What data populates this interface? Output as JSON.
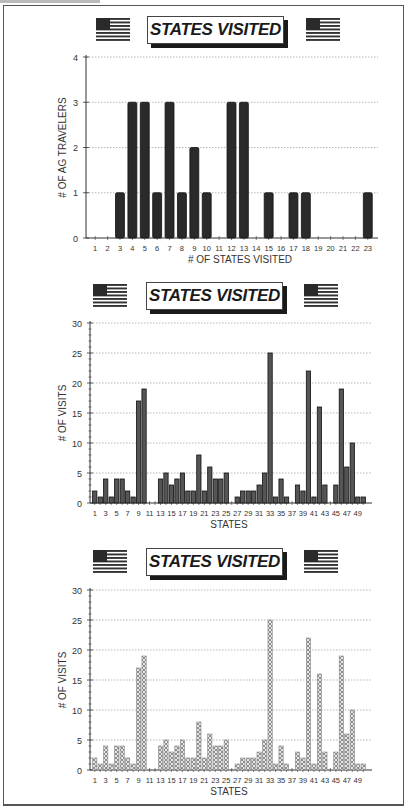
{
  "page": {
    "panels": [
      {
        "title": "STATES VISITED",
        "left_icon": "us-flag-icon",
        "right_icon": "us-flag-icon"
      },
      {
        "title": "STATES VISITED",
        "left_icon": "us-flag-icon",
        "right_icon": "us-flag-icon"
      },
      {
        "title": "STATES VISITED",
        "left_icon": "us-flag-icon",
        "right_icon": "us-flag-icon"
      }
    ],
    "colors": {
      "bar_solid": "#2a2a2a",
      "bar_medium": "#555555",
      "bar_hatched": "#bdbdbd",
      "grid": "#999999",
      "axis": "#333333"
    }
  },
  "chart_data": [
    {
      "type": "bar",
      "title": "STATES VISITED",
      "xlabel": "# OF STATES VISITED",
      "ylabel": "# OF AG TRAVELERS",
      "ylim": [
        0,
        4
      ],
      "yticks": [
        0,
        1,
        2,
        3,
        4
      ],
      "grid": true,
      "legend": null,
      "categories": [
        "1",
        "2",
        "3",
        "4",
        "5",
        "6",
        "7",
        "8",
        "9",
        "10",
        "11",
        "12",
        "13",
        "14",
        "15",
        "16",
        "17",
        "18",
        "19",
        "20",
        "21",
        "22",
        "23"
      ],
      "xtick_labels": [
        "1",
        "2",
        "3",
        "4",
        "5",
        "6",
        "7",
        "8",
        "9",
        "10",
        "11",
        "12",
        "13",
        "14",
        "15",
        "16",
        "17",
        "18",
        "19",
        "20",
        "21",
        "22",
        "23"
      ],
      "values": [
        0,
        0,
        1,
        3,
        3,
        1,
        3,
        1,
        2,
        1,
        0,
        3,
        3,
        0,
        1,
        0,
        1,
        1,
        0,
        0,
        0,
        0,
        1
      ],
      "style": "solid-dark"
    },
    {
      "type": "bar",
      "title": "STATES VISITED",
      "xlabel": "STATES",
      "ylabel": "# OF VISITS",
      "ylim": [
        0,
        30
      ],
      "yticks": [
        0,
        5,
        10,
        15,
        20,
        25,
        30
      ],
      "grid": true,
      "legend": null,
      "categories": [
        "1",
        "2",
        "3",
        "4",
        "5",
        "6",
        "7",
        "8",
        "9",
        "10",
        "11",
        "12",
        "13",
        "14",
        "15",
        "16",
        "17",
        "18",
        "19",
        "20",
        "21",
        "22",
        "23",
        "24",
        "25",
        "26",
        "27",
        "28",
        "29",
        "30",
        "31",
        "32",
        "33",
        "34",
        "35",
        "36",
        "37",
        "38",
        "39",
        "40",
        "41",
        "42",
        "43",
        "44",
        "45",
        "46",
        "47",
        "48",
        "49",
        "50"
      ],
      "xtick_labels": [
        "1",
        "3",
        "5",
        "7",
        "9",
        "11",
        "13",
        "15",
        "17",
        "19",
        "21",
        "23",
        "25",
        "27",
        "29",
        "31",
        "33",
        "35",
        "37",
        "39",
        "41",
        "43",
        "45",
        "47",
        "49"
      ],
      "values": [
        2,
        1,
        4,
        1,
        4,
        4,
        2,
        1,
        17,
        19,
        0,
        0,
        4,
        5,
        3,
        4,
        5,
        2,
        2,
        8,
        2,
        6,
        4,
        4,
        5,
        0,
        1,
        2,
        2,
        2,
        3,
        5,
        25,
        1,
        4,
        1,
        0,
        3,
        2,
        22,
        1,
        16,
        3,
        0,
        3,
        19,
        6,
        10,
        1,
        1
      ],
      "style": "solid-medium"
    },
    {
      "type": "bar",
      "title": "STATES VISITED",
      "xlabel": "STATES",
      "ylabel": "# OF VISITS",
      "ylim": [
        0,
        30
      ],
      "yticks": [
        0,
        5,
        10,
        15,
        20,
        25,
        30
      ],
      "grid": true,
      "legend": null,
      "categories": [
        "1",
        "2",
        "3",
        "4",
        "5",
        "6",
        "7",
        "8",
        "9",
        "10",
        "11",
        "12",
        "13",
        "14",
        "15",
        "16",
        "17",
        "18",
        "19",
        "20",
        "21",
        "22",
        "23",
        "24",
        "25",
        "26",
        "27",
        "28",
        "29",
        "30",
        "31",
        "32",
        "33",
        "34",
        "35",
        "36",
        "37",
        "38",
        "39",
        "40",
        "41",
        "42",
        "43",
        "44",
        "45",
        "46",
        "47",
        "48",
        "49",
        "50"
      ],
      "xtick_labels": [
        "1",
        "3",
        "5",
        "7",
        "9",
        "11",
        "13",
        "15",
        "17",
        "19",
        "21",
        "23",
        "25",
        "27",
        "29",
        "31",
        "33",
        "35",
        "37",
        "39",
        "41",
        "43",
        "45",
        "47",
        "49"
      ],
      "values": [
        2,
        1,
        4,
        1,
        4,
        4,
        2,
        1,
        17,
        19,
        0,
        0,
        4,
        5,
        3,
        4,
        5,
        2,
        2,
        8,
        2,
        6,
        4,
        4,
        5,
        0,
        1,
        2,
        2,
        2,
        3,
        5,
        25,
        1,
        4,
        1,
        0,
        3,
        2,
        22,
        1,
        16,
        3,
        0,
        3,
        19,
        6,
        10,
        1,
        1
      ],
      "style": "hatched"
    }
  ]
}
